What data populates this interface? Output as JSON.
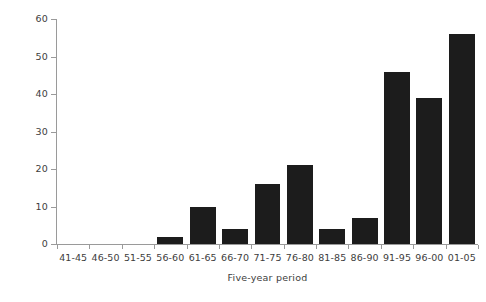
{
  "chart_data": {
    "type": "bar",
    "title": "",
    "subtitle": "",
    "xlabel": "Five-year period",
    "ylabel": "Number of birds",
    "categories": [
      "41-45",
      "46-50",
      "51-55",
      "56-60",
      "61-65",
      "66-70",
      "71-75",
      "76-80",
      "81-85",
      "86-90",
      "91-95",
      "96-00",
      "01-05"
    ],
    "values": [
      0,
      0,
      0,
      2,
      10,
      4,
      16,
      21,
      4,
      7,
      46,
      39,
      56
    ],
    "ylim": [
      0,
      60
    ],
    "yticks": [
      0,
      10,
      20,
      30,
      40,
      50,
      60
    ],
    "ytick_labels": [
      "0",
      "10",
      "20",
      "30",
      "40",
      "50",
      "60"
    ],
    "grid": false,
    "legend": false,
    "legend_position": "none",
    "bar_color": "#1c1c1c",
    "axis_color": "#9a9a9a",
    "text_color": "#3d3d3d",
    "background_color": "#ffffff"
  }
}
